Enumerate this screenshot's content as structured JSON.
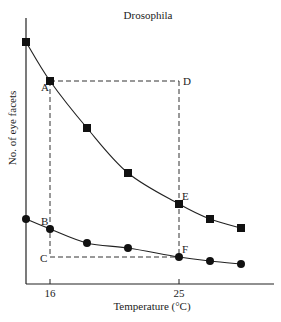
{
  "chart_data": {
    "type": "line",
    "title": "Drosophila",
    "xlabel": "Temperature (°C)",
    "ylabel": "No. of eye facets",
    "x_ticks": [
      16,
      25
    ],
    "x": [
      14.3,
      16,
      18.6,
      21.4,
      25,
      27.2,
      29.3
    ],
    "xlim": [
      14.3,
      31.5
    ],
    "grid": false,
    "legend": "none",
    "series": [
      {
        "name": "upper curve",
        "marker": "square",
        "values_px_y": [
          42,
          81,
          128,
          173,
          204,
          219,
          228
        ]
      },
      {
        "name": "lower curve",
        "marker": "circle",
        "values_px_y": [
          219,
          229,
          243,
          248,
          257,
          261,
          264
        ]
      }
    ],
    "annotations": [
      {
        "label": "A",
        "x": 16,
        "series": "upper curve"
      },
      {
        "label": "B",
        "x": 16,
        "series": "lower curve"
      },
      {
        "label": "C",
        "x": 16,
        "note": "bottom-left corner of dashed rectangle"
      },
      {
        "label": "D",
        "x": 25,
        "note": "top-right corner of dashed rectangle"
      },
      {
        "label": "E",
        "x": 25,
        "series": "upper curve"
      },
      {
        "label": "F",
        "x": 25,
        "series": "lower curve"
      }
    ],
    "dashed_rectangle": {
      "corners": [
        "A",
        "D",
        "F",
        "C"
      ]
    }
  },
  "layout": {
    "x_px": [
      26,
      50,
      87,
      128,
      179,
      210,
      241
    ],
    "axis": {
      "x0": 26,
      "y0": 284,
      "x1": 274,
      "ytop": 18
    },
    "tick_px": [
      50,
      179
    ],
    "rect": {
      "x0": 50,
      "y0": 81,
      "x1": 179,
      "y1": 257
    }
  }
}
